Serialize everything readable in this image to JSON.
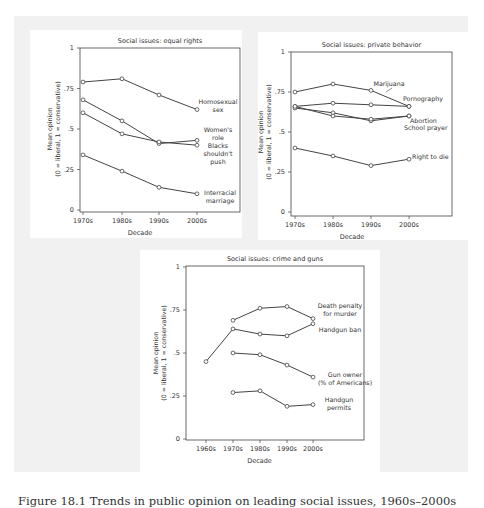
{
  "figure": {
    "caption": "Figure 18.1  Trends in public opinion on leading social issues, 1960s–2000s",
    "background_color": "#f1f1f1",
    "line_color": "#444444"
  },
  "chart_data": [
    {
      "type": "line",
      "title": "Social issues: equal rights",
      "xlabel": "Decade",
      "ylabel": "Mean opinion (0 = liberal, 1 = conservative)",
      "ylabel_line1": "Mean opinion",
      "ylabel_line2": "(0 = liberal, 1 = conservative)",
      "ylim": [
        0,
        1
      ],
      "yticks": [
        "0",
        ".25",
        ".5",
        ".75",
        "1"
      ],
      "categories": [
        "1970s",
        "1980s",
        "1990s",
        "2000s"
      ],
      "grid": false,
      "legend": "inline labels at line ends",
      "series": [
        {
          "name": "Homosexual sex",
          "label_lines": [
            "Homosexual",
            "sex"
          ],
          "values": [
            0.79,
            0.81,
            0.71,
            0.62
          ]
        },
        {
          "name": "Women's role",
          "label_lines": [
            "Women's",
            "role"
          ],
          "values": [
            0.68,
            0.55,
            0.41,
            0.43
          ]
        },
        {
          "name": "Blacks shouldn't push",
          "label_lines": [
            "Blacks",
            "shouldn't",
            "push"
          ],
          "values": [
            0.6,
            0.47,
            0.42,
            0.4
          ]
        },
        {
          "name": "Interracial marriage",
          "label_lines": [
            "Interracial",
            "marriage"
          ],
          "values": [
            0.34,
            0.24,
            0.14,
            0.1
          ]
        }
      ]
    },
    {
      "type": "line",
      "title": "Social issues: private behavior",
      "xlabel": "Decade",
      "ylabel": "Mean opinion (0 = liberal, 1 = conservative)",
      "ylabel_line1": "Mean opinion",
      "ylabel_line2": "(0 = liberal, 1 = conservative)",
      "ylim": [
        0,
        1
      ],
      "yticks": [
        "0",
        ".25",
        ".5",
        ".75",
        "1"
      ],
      "categories": [
        "1970s",
        "1980s",
        "1990s",
        "2000s"
      ],
      "grid": false,
      "legend": "inline labels at line ends",
      "series": [
        {
          "name": "Marijuana",
          "label_lines": [
            "Marijuana"
          ],
          "values": [
            0.75,
            0.8,
            0.76,
            0.66
          ]
        },
        {
          "name": "Pornography",
          "label_lines": [
            "Pornography"
          ],
          "values": [
            0.66,
            0.68,
            0.67,
            0.66
          ]
        },
        {
          "name": "Abortion",
          "label_lines": [
            "Abortion"
          ],
          "values": [
            0.65,
            0.62,
            0.57,
            0.6
          ]
        },
        {
          "name": "School prayer",
          "label_lines": [
            "School prayer"
          ],
          "values": [
            0.66,
            0.6,
            0.58,
            0.6
          ]
        },
        {
          "name": "Right to die",
          "label_lines": [
            "Right to die"
          ],
          "values": [
            0.4,
            0.35,
            0.29,
            0.33
          ]
        }
      ]
    },
    {
      "type": "line",
      "title": "Social issues: crime and guns",
      "xlabel": "Decade",
      "ylabel": "Mean opinion (0 = liberal, 1 = conservative)",
      "ylabel_line1": "Mean opinion",
      "ylabel_line2": "(0 = liberal, 1 = conservative)",
      "ylim": [
        0,
        1
      ],
      "yticks": [
        "0",
        ".25",
        ".5",
        ".75",
        "1"
      ],
      "categories": [
        "1960s",
        "1970s",
        "1980s",
        "1990s",
        "2000s"
      ],
      "grid": false,
      "legend": "inline labels at line ends",
      "series": [
        {
          "name": "Death penalty for murder",
          "label_lines": [
            "Death penalty",
            "for murder"
          ],
          "values": [
            null,
            0.69,
            0.76,
            0.77,
            0.7
          ]
        },
        {
          "name": "Handgun ban",
          "label_lines": [
            "Handgun ban"
          ],
          "values": [
            0.45,
            0.64,
            0.61,
            0.6,
            0.67
          ]
        },
        {
          "name": "Gun owner (% of Americans)",
          "label_lines": [
            "Gun owner",
            "(% of Americans)"
          ],
          "values": [
            null,
            0.5,
            0.49,
            0.43,
            0.36
          ]
        },
        {
          "name": "Handgun permits",
          "label_lines": [
            "Handgun",
            "permits"
          ],
          "values": [
            null,
            0.27,
            0.28,
            0.19,
            0.2
          ]
        }
      ]
    }
  ]
}
